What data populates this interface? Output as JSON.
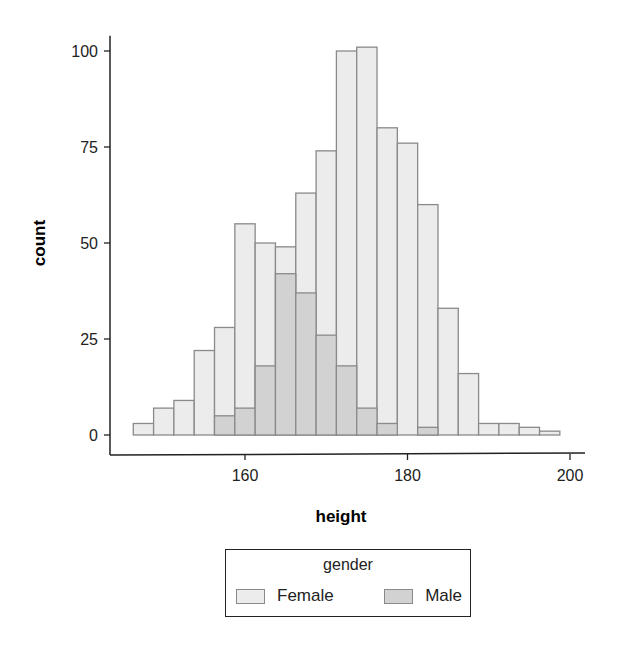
{
  "chart_data": {
    "type": "bar",
    "subtype": "stacked-histogram-overlapping",
    "title": "",
    "xlabel": "height",
    "ylabel": "count",
    "xlim": [
      144,
      202
    ],
    "ylim": [
      -4,
      104
    ],
    "xticks": [
      160,
      180,
      200
    ],
    "yticks": [
      0,
      25,
      50,
      75,
      100
    ],
    "bin_width": 2.5,
    "bin_centers": [
      147.5,
      150,
      152.5,
      155,
      157.5,
      160,
      162.5,
      165,
      167.5,
      170,
      172.5,
      175,
      177.5,
      180,
      182.5,
      185,
      187.5,
      190,
      192.5,
      195,
      197.5
    ],
    "series": [
      {
        "name": "Female",
        "color": "#ececec",
        "values": [
          3,
          7,
          9,
          22,
          28,
          55,
          50,
          49,
          63,
          74,
          100,
          101,
          80,
          76,
          60,
          33,
          16,
          3,
          3,
          2,
          1
        ]
      },
      {
        "name": "Male",
        "color": "#d2d2d2",
        "values": [
          0,
          0,
          0,
          0,
          5,
          7,
          18,
          42,
          37,
          26,
          18,
          7,
          3,
          0,
          2,
          0,
          0,
          0,
          0,
          0,
          0
        ]
      }
    ],
    "note": "Female values here are total bar heights (female bars drawn behind, male bars overlaid from zero).",
    "grid": false,
    "legend": {
      "title": "gender",
      "position": "bottom",
      "entries": [
        "Female",
        "Male"
      ]
    }
  },
  "axes": {
    "x_title": "height",
    "y_title": "count",
    "x_ticks": [
      "160",
      "180",
      "200"
    ],
    "y_ticks": [
      "0",
      "25",
      "50",
      "75",
      "100"
    ]
  },
  "legend": {
    "title": "gender",
    "items": [
      {
        "label": "Female",
        "color": "#ececec"
      },
      {
        "label": "Male",
        "color": "#d2d2d2"
      }
    ]
  },
  "style": {
    "outline": "#8a8a8a",
    "axis": "#222222"
  }
}
